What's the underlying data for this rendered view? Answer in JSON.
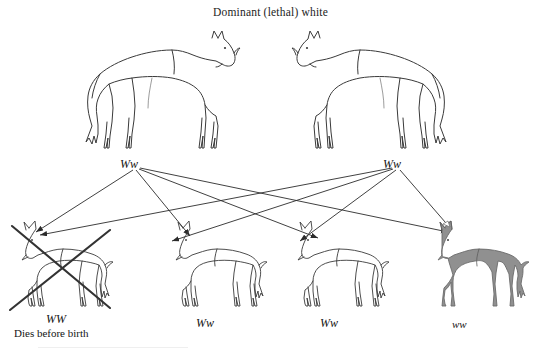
{
  "title": "Dominant (lethal) white",
  "colors": {
    "line": "#3a3a3a",
    "arrow": "#2b2b2b",
    "cross": "#333333",
    "gray_coat": "#909090",
    "gray_coat_outline": "#6b6b6b",
    "background": "#ffffff",
    "text": "#141414"
  },
  "parents": [
    {
      "id": "parent-left",
      "genotype": "Ww",
      "coat": "white",
      "facing": "right"
    },
    {
      "id": "parent-right",
      "genotype": "Ww",
      "coat": "white",
      "facing": "left"
    }
  ],
  "offspring": [
    {
      "id": "offspring-1",
      "genotype": "WW",
      "note": "Dies before birth",
      "coat": "white",
      "facing": "left",
      "lethal": true
    },
    {
      "id": "offspring-2",
      "genotype": "Ww",
      "note": "",
      "coat": "white",
      "facing": "left",
      "lethal": false
    },
    {
      "id": "offspring-3",
      "genotype": "Ww",
      "note": "",
      "coat": "white",
      "facing": "left",
      "lethal": false
    },
    {
      "id": "offspring-4",
      "genotype": "ww",
      "note": "",
      "coat": "gray",
      "facing": "left",
      "lethal": false
    }
  ],
  "icons": {
    "horse": "horse-icon",
    "foal": "foal-icon",
    "lethal_cross": "cross-out-icon",
    "inheritance_arrow": "arrow-icon"
  }
}
